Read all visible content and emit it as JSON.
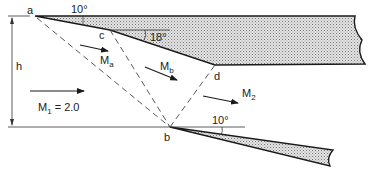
{
  "diagram": {
    "points": {
      "a": "a",
      "b": "b",
      "c": "c",
      "d": "d"
    },
    "height_label": "h",
    "angles": {
      "upper_wall": "10°",
      "corner_c": "18°",
      "lower_wedge": "10°"
    },
    "regions": {
      "freestream": {
        "symbol": "M",
        "sub": "1",
        "value": " = 2.0"
      },
      "region_a": {
        "symbol": "M",
        "sub": "a"
      },
      "region_b": {
        "symbol": "M",
        "sub": "b"
      },
      "downstream": {
        "symbol": "M",
        "sub": "2"
      }
    },
    "colors": {
      "line": "#1a1a1a",
      "fill": "#c8c8c8",
      "dash": "#444444"
    }
  }
}
